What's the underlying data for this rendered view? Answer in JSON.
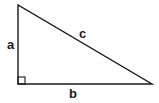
{
  "diagram": {
    "vertices": {
      "top": [
        18,
        5
      ],
      "right_angle": [
        18,
        84
      ],
      "right": [
        152,
        84
      ]
    },
    "sides": [
      {
        "name": "a",
        "label": "a",
        "role": "vertical leg"
      },
      {
        "name": "b",
        "label": "b",
        "role": "horizontal leg"
      },
      {
        "name": "c",
        "label": "c",
        "role": "hypotenuse"
      }
    ],
    "right_angle_marker": true,
    "stroke_color": "#1a1a1a",
    "background": "#ffffff"
  }
}
